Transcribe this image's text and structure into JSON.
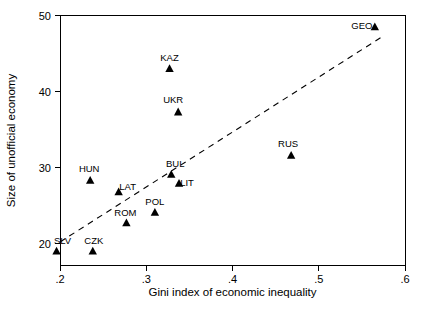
{
  "chart_data": {
    "type": "scatter",
    "title": "",
    "xlabel": "Gini index of  economic inequality",
    "ylabel": "Size of unofficial economy",
    "xlim": [
      0.2,
      0.6
    ],
    "ylim": [
      18.2,
      50.5
    ],
    "xticks": [
      ".2",
      ".3",
      ".4",
      ".5",
      ".6"
    ],
    "xtick_values": [
      0.2,
      0.3,
      0.4,
      0.5,
      0.6
    ],
    "yticks": [
      "20",
      "30",
      "40",
      "50"
    ],
    "ytick_values": [
      20,
      30,
      40,
      50
    ],
    "grid": false,
    "legend": "none",
    "marker": "triangle",
    "marker_color": "#000000",
    "points": [
      {
        "label": "SLV",
        "x": 0.196,
        "y": 19.0,
        "label_dx": 6,
        "label_dy": -7
      },
      {
        "label": "CZK",
        "x": 0.238,
        "y": 19.0,
        "label_dx": 1,
        "label_dy": -7
      },
      {
        "label": "ROM",
        "x": 0.277,
        "y": 22.7,
        "label_dx": -1,
        "label_dy": -7
      },
      {
        "label": "POL",
        "x": 0.31,
        "y": 24.1,
        "label_dx": 0,
        "label_dy": -7
      },
      {
        "label": "LAT",
        "x": 0.268,
        "y": 26.8,
        "label_dx": 9,
        "label_dy": -2
      },
      {
        "label": "HUN",
        "x": 0.235,
        "y": 28.3,
        "label_dx": -1,
        "label_dy": -8
      },
      {
        "label": "LIT",
        "x": 0.338,
        "y": 27.9,
        "label_dx": 8,
        "label_dy": 3
      },
      {
        "label": "BUL",
        "x": 0.329,
        "y": 29.1,
        "label_dx": 4,
        "label_dy": -7
      },
      {
        "label": "RUS",
        "x": 0.468,
        "y": 31.6,
        "label_dx": -3,
        "label_dy": -8
      },
      {
        "label": "UKR",
        "x": 0.337,
        "y": 37.3,
        "label_dx": -5,
        "label_dy": -9
      },
      {
        "label": "KAZ",
        "x": 0.327,
        "y": 43.0,
        "label_dx": 0,
        "label_dy": -8
      },
      {
        "label": "GEO",
        "x": 0.565,
        "y": 48.5,
        "label_dx": -13,
        "label_dy": 2
      }
    ],
    "trend_line": {
      "style": "dashed",
      "x_start": 0.2,
      "y_start": 20.2,
      "x_end": 0.572,
      "y_end": 47.1
    },
    "annotations": []
  }
}
